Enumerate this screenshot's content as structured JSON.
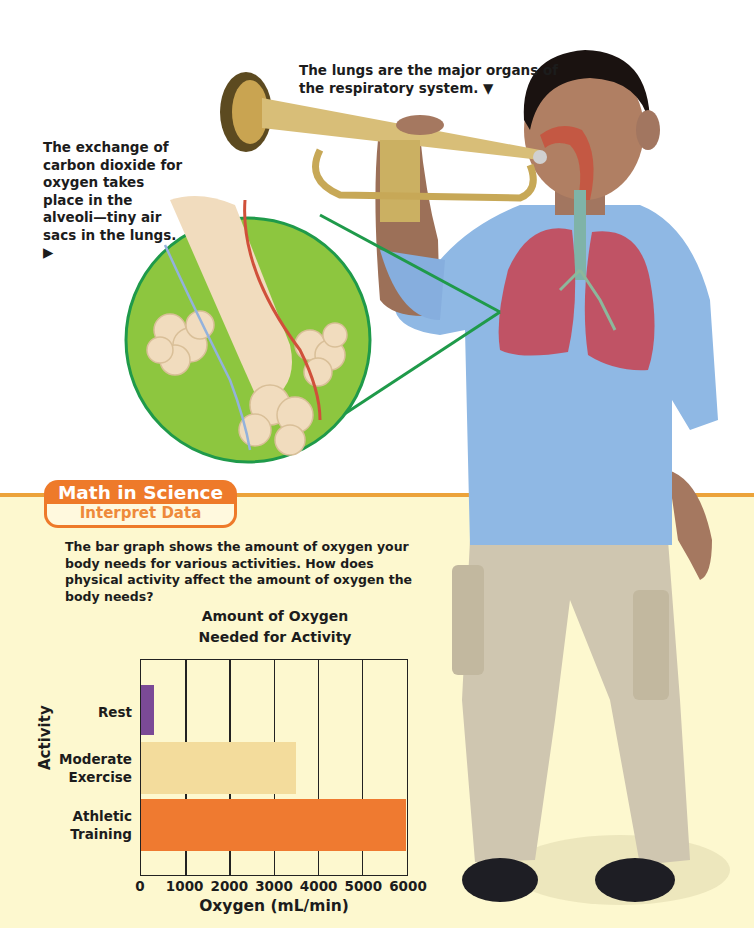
{
  "captions": {
    "alveoli": "The exchange of carbon dioxide for oxygen takes place in the alveoli—tiny air sacs in the lungs. ▶",
    "lungs": "The lungs are the major organs of the respiratory system. ▼"
  },
  "feature_badge": {
    "title": "Math in Science",
    "subtitle": "Interpret Data"
  },
  "prompt": "The bar graph shows the amount of oxygen your body needs for various activities. How does physical activity affect the amount of oxygen the body needs?",
  "colors": {
    "accent_orange": "#ee7a2a",
    "cream_background": "#fdf8cf",
    "rest_bar": "#7b4a96",
    "moderate_bar": "#f3dc9c",
    "athletic_bar": "#ef7a30",
    "zoom_circle_green": "#8dc63f",
    "zoom_outline_green": "#1f9a4a",
    "shirt_blue": "#8fb8e4",
    "pants_khaki": "#cfc6b0"
  },
  "chart_data": {
    "type": "bar",
    "orientation": "horizontal",
    "title": "Amount of Oxygen Needed for Activity",
    "title_lines": [
      "Amount of Oxygen",
      "Needed for Activity"
    ],
    "categories": [
      "Rest",
      "Moderate Exercise",
      "Athletic Training"
    ],
    "category_lines": [
      [
        "Rest"
      ],
      [
        "Moderate",
        "Exercise"
      ],
      [
        "Athletic",
        "Training"
      ]
    ],
    "values": [
      300,
      3500,
      6000
    ],
    "bar_colors": [
      "#7b4a96",
      "#f3dc9c",
      "#ef7a30"
    ],
    "xlabel": "Oxygen (mL/min)",
    "ylabel": "Activity",
    "xlim": [
      0,
      6000
    ],
    "x_ticks": [
      "0",
      "1000",
      "2000",
      "3000",
      "4000",
      "5000",
      "6000"
    ],
    "grid": "vertical",
    "legend": "none"
  },
  "illustration": {
    "subjects": [
      "boy playing trumpet",
      "lungs overlay",
      "alveoli magnified inset"
    ]
  }
}
